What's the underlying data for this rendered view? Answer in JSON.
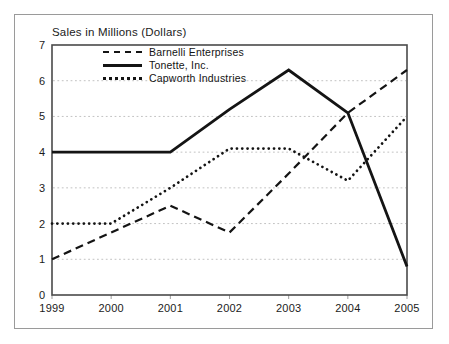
{
  "title_note": "standalone scanned chart",
  "chart_data": {
    "type": "line",
    "title": "Sales in Millions (Dollars)",
    "xlabel": "",
    "ylabel": "",
    "x": [
      "1999",
      "2000",
      "2001",
      "2002",
      "2003",
      "2004",
      "2005"
    ],
    "yticks": [
      0,
      1,
      2,
      3,
      4,
      5,
      6,
      7
    ],
    "ylim": [
      0,
      7
    ],
    "grid": "horizontal-dotted",
    "legend_position": "top-left-inside",
    "series": [
      {
        "name": "Barnelli Enterprises",
        "style": "dashed",
        "color": "#141414",
        "values": [
          1.0,
          1.75,
          2.5,
          1.75,
          3.4,
          5.1,
          6.3
        ]
      },
      {
        "name": "Tonette, Inc.",
        "style": "solid",
        "color": "#141414",
        "values": [
          4.0,
          4.0,
          4.0,
          5.2,
          6.3,
          5.1,
          0.8
        ]
      },
      {
        "name": "Capworth Industries",
        "style": "dotted",
        "color": "#141414",
        "values": [
          2.0,
          2.0,
          3.0,
          4.1,
          4.1,
          3.2,
          5.0
        ]
      }
    ]
  },
  "colors": {
    "frame_border": "#9a9a9a",
    "plot_border": "#4a4a4a",
    "gridline": "#c2c2c2",
    "tick": "#9c9c9c",
    "text": "#1b1b1b"
  }
}
